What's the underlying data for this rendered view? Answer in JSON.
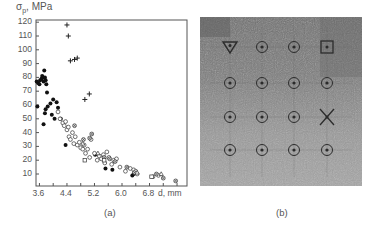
{
  "figure": {
    "panel_a_label": "(a)",
    "panel_b_label": "(b)"
  },
  "chart_data": {
    "type": "scatter",
    "title": "",
    "xlabel": "d, mm",
    "ylabel": "σp , MPa",
    "ylabel_main": "σ",
    "ylabel_sub": "p",
    "ylabel_unit": ", MPa",
    "xlim": [
      3.5,
      7.9
    ],
    "ylim": [
      0,
      121
    ],
    "x_ticks": [
      3.6,
      4.4,
      5.2,
      6.0,
      6.8
    ],
    "x_tick_labels": [
      "3.6",
      "4.4",
      "5.2",
      "6.0",
      "6.8"
    ],
    "y_ticks": [
      10,
      20,
      30,
      40,
      50,
      60,
      70,
      80,
      90,
      100,
      110,
      120
    ],
    "y_tick_labels": [
      "10",
      "20",
      "30",
      "40",
      "50",
      "60",
      "70",
      "80",
      "90",
      "100",
      "110",
      "120"
    ],
    "grid": false,
    "legend": "none",
    "series": [
      {
        "name": "cross",
        "marker": "+",
        "points": [
          [
            4.4,
            118
          ],
          [
            4.44,
            110
          ],
          [
            4.5,
            92
          ],
          [
            4.62,
            93
          ],
          [
            4.7,
            94
          ],
          [
            4.92,
            64
          ],
          [
            5.05,
            68
          ]
        ]
      },
      {
        "name": "filled-circle",
        "marker": "filled",
        "points": [
          [
            3.52,
            77
          ],
          [
            3.56,
            76
          ],
          [
            3.6,
            75
          ],
          [
            3.62,
            78
          ],
          [
            3.66,
            79
          ],
          [
            3.68,
            81
          ],
          [
            3.7,
            80
          ],
          [
            3.72,
            77
          ],
          [
            3.74,
            85
          ],
          [
            3.76,
            80
          ],
          [
            3.78,
            78
          ],
          [
            3.8,
            75
          ],
          [
            3.82,
            69
          ],
          [
            3.54,
            59
          ],
          [
            3.72,
            46
          ],
          [
            3.76,
            54
          ],
          [
            3.78,
            57
          ],
          [
            3.84,
            59
          ],
          [
            3.92,
            61
          ],
          [
            3.96,
            53
          ],
          [
            4.0,
            64
          ],
          [
            4.04,
            50
          ],
          [
            4.1,
            62
          ],
          [
            4.14,
            58
          ],
          [
            4.22,
            50
          ],
          [
            4.36,
            31
          ],
          [
            5.22,
            24
          ],
          [
            5.52,
            14
          ],
          [
            5.72,
            13
          ],
          [
            6.3,
            9
          ],
          [
            6.34,
            10
          ]
        ]
      },
      {
        "name": "open-circle",
        "marker": "open",
        "points": [
          [
            4.14,
            55
          ],
          [
            4.2,
            50
          ],
          [
            4.28,
            47
          ],
          [
            4.32,
            45
          ],
          [
            4.36,
            48
          ],
          [
            4.4,
            42
          ],
          [
            4.44,
            44
          ],
          [
            4.46,
            37
          ],
          [
            4.5,
            35
          ],
          [
            4.56,
            40
          ],
          [
            4.6,
            32
          ],
          [
            4.64,
            37
          ],
          [
            4.7,
            31
          ],
          [
            4.76,
            33
          ],
          [
            4.8,
            29
          ],
          [
            4.86,
            28
          ],
          [
            4.9,
            31
          ],
          [
            4.94,
            25
          ],
          [
            5.0,
            28
          ],
          [
            5.06,
            22
          ],
          [
            5.1,
            35
          ],
          [
            5.2,
            25
          ],
          [
            5.28,
            20
          ],
          [
            5.34,
            23
          ],
          [
            5.4,
            21
          ],
          [
            5.46,
            24
          ],
          [
            5.5,
            18
          ],
          [
            5.56,
            26
          ],
          [
            5.62,
            22
          ],
          [
            5.7,
            17
          ],
          [
            5.76,
            20
          ],
          [
            5.84,
            21
          ],
          [
            5.94,
            15
          ],
          [
            6.1,
            12
          ],
          [
            6.24,
            14
          ],
          [
            6.34,
            13
          ],
          [
            6.4,
            12
          ],
          [
            6.44,
            10
          ],
          [
            6.9,
            8
          ],
          [
            7.06,
            9
          ]
        ]
      },
      {
        "name": "crossed-circle",
        "marker": "crossed",
        "points": [
          [
            4.62,
            45
          ],
          [
            4.88,
            35
          ],
          [
            5.06,
            36
          ],
          [
            5.12,
            39
          ],
          [
            5.48,
            22
          ],
          [
            5.64,
            21
          ],
          [
            5.8,
            19
          ],
          [
            6.14,
            15
          ],
          [
            6.36,
            11
          ],
          [
            7.0,
            10
          ],
          [
            7.2,
            7
          ],
          [
            7.56,
            5
          ]
        ]
      },
      {
        "name": "triangle",
        "marker": "triangle",
        "points": [
          [
            4.86,
            32
          ],
          [
            5.3,
            25
          ],
          [
            6.44,
            11
          ],
          [
            7.14,
            10
          ]
        ]
      },
      {
        "name": "square",
        "marker": "square",
        "points": [
          [
            4.92,
            20
          ],
          [
            5.48,
            20
          ],
          [
            6.86,
            8
          ]
        ]
      }
    ]
  },
  "photo": {
    "description": "Grayscale photograph of a specimen surface with a 4x4 grid of marked points",
    "rows": [
      [
        "triangle",
        "circle",
        "circle",
        "square"
      ],
      [
        "circle",
        "circle",
        "circle",
        "circle"
      ],
      [
        "circle",
        "circle",
        "circle",
        "x-mark"
      ],
      [
        "circle",
        "circle",
        "circle",
        "circle"
      ]
    ]
  }
}
